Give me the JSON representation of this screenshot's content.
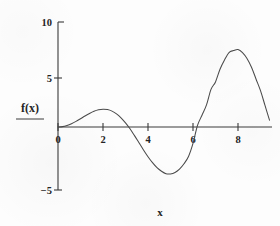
{
  "chart_data": {
    "type": "line",
    "title": "",
    "subtitle": "",
    "xlabel": "x",
    "ylabel": "f(x)",
    "xlim": [
      -0.55,
      9.45
    ],
    "ylim": [
      -5,
      10
    ],
    "grid": false,
    "legend": null,
    "x_ticks": [
      0,
      2,
      4,
      6,
      8
    ],
    "x_tick_labels": [
      "0",
      "2",
      "4",
      "6",
      "8"
    ],
    "y_ticks": [
      -5,
      5,
      10
    ],
    "y_tick_labels": [
      "−5",
      "5",
      "10"
    ],
    "series": [
      {
        "name": "f(x)",
        "color": "#4a4a4a",
        "x": [
          0,
          0.2,
          0.4,
          0.6,
          0.8,
          1.0,
          1.2,
          1.4,
          1.6,
          1.8,
          2.0,
          2.2,
          2.4,
          2.6,
          2.8,
          3.0,
          3.2,
          3.4,
          3.6,
          3.8,
          4.0,
          4.2,
          4.4,
          4.6,
          4.8,
          5.0,
          5.2,
          5.4,
          5.6,
          5.8,
          6.0,
          6.2,
          6.4,
          6.6,
          6.8,
          7.0,
          7.2,
          7.4,
          7.6,
          7.8,
          8.0,
          8.2,
          8.4,
          8.6,
          8.8,
          9.0,
          9.2,
          9.4
        ],
        "y": [
          0,
          0.04,
          0.16,
          0.34,
          0.57,
          0.84,
          1.12,
          1.38,
          1.6,
          1.75,
          1.82,
          1.78,
          1.62,
          1.34,
          0.94,
          0.42,
          -0.18,
          -0.88,
          -1.61,
          -2.34,
          -3.03,
          -3.64,
          -4.15,
          -4.52,
          -4.77,
          -4.79,
          -4.64,
          -4.3,
          -3.75,
          -3.01,
          -1.68,
          0.16,
          1.2,
          2.25,
          3.84,
          4.6,
          5.9,
          6.84,
          7.6,
          7.8,
          7.91,
          7.6,
          7.0,
          6.1,
          4.9,
          3.71,
          2.2,
          0.7
        ]
      }
    ],
    "annotations": []
  },
  "axes": {
    "y_axis_label": "f(x)",
    "x_axis_label": "x"
  },
  "ticks": {
    "y": [
      {
        "value": 10,
        "label": "10"
      },
      {
        "value": 5,
        "label": "5"
      },
      {
        "value": -5,
        "label": "−5"
      }
    ],
    "x": [
      {
        "value": 0,
        "label": "0"
      },
      {
        "value": 2,
        "label": "2"
      },
      {
        "value": 4,
        "label": "4"
      },
      {
        "value": 6,
        "label": "6"
      },
      {
        "value": 8,
        "label": "8"
      }
    ]
  },
  "style": {
    "axis_color": "#3a3a3a",
    "curve_color": "#4a4a4a",
    "background": "#fdfdfd",
    "text_color": "#242424"
  }
}
